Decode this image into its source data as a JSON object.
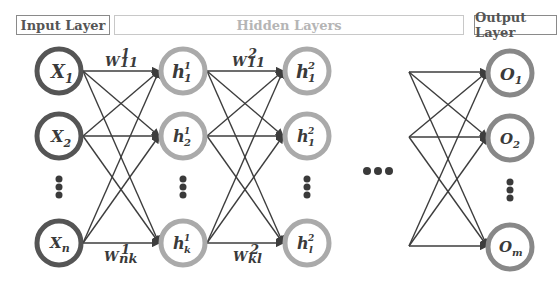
{
  "layer_labels": {
    "input": "Input Layer",
    "hidden": "Hidden Layers",
    "output": "Output Layer"
  },
  "colors": {
    "input_node": "#555555",
    "hidden_node": "#aaaaaa",
    "output_node": "#888888",
    "edge": "#3d3d3d",
    "hidden_label": "#b5b5b5"
  },
  "nodes": {
    "input": [
      {
        "base": "X",
        "sub": "1"
      },
      {
        "base": "X",
        "sub": "2"
      },
      {
        "base": "X",
        "sub": "n"
      }
    ],
    "hidden1": [
      {
        "base": "h",
        "sub": "1",
        "sup": "1"
      },
      {
        "base": "h",
        "sub": "2",
        "sup": "1"
      },
      {
        "base": "h",
        "sub": "k",
        "sup": "1"
      }
    ],
    "hidden2": [
      {
        "base": "h",
        "sub": "1",
        "sup": "2"
      },
      {
        "base": "h",
        "sub": "1",
        "sup": "2"
      },
      {
        "base": "h",
        "sub": "l",
        "sup": "2"
      }
    ],
    "output": [
      {
        "base": "O",
        "sub": "1"
      },
      {
        "base": "O",
        "sub": "2"
      },
      {
        "base": "O",
        "sub": "m"
      }
    ]
  },
  "weights": {
    "w1_top": {
      "base": "W",
      "sup": "1",
      "sub": "11"
    },
    "w1_bottom": {
      "base": "W",
      "sup": "1",
      "sub": "nk"
    },
    "w2_top": {
      "base": "W",
      "sup": "2",
      "sub": "11"
    },
    "w2_bottom": {
      "base": "W",
      "sup": "2",
      "sub": "kl"
    }
  },
  "ellipsis": "•••"
}
